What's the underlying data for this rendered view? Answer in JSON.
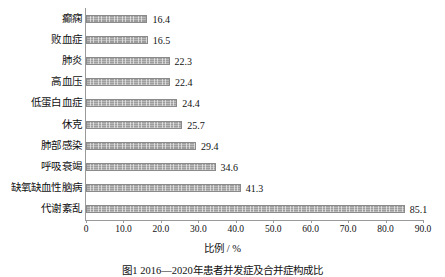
{
  "chart_data": {
    "type": "bar",
    "orientation": "horizontal",
    "title": "",
    "xlabel": "比例 / %",
    "ylabel": "",
    "xlim": [
      0,
      90
    ],
    "xticks": [
      "0",
      "10.0",
      "20.0",
      "30.0",
      "40.0",
      "50.0",
      "60.0",
      "70.0",
      "80.0",
      "90.0"
    ],
    "xtick_values": [
      0,
      10,
      20,
      30,
      40,
      50,
      60,
      70,
      80,
      90
    ],
    "grid": false,
    "legend": "none",
    "categories": [
      "癫痫",
      "败血症",
      "肺炎",
      "高血压",
      "低蛋白血症",
      "休克",
      "肺部感染",
      "呼吸衰竭",
      "缺氧缺血性脑病",
      "代谢紊乱"
    ],
    "values": [
      16.4,
      16.5,
      22.3,
      22.4,
      24.4,
      25.7,
      29.4,
      34.6,
      41.3,
      85.1
    ],
    "value_labels": [
      "16.4",
      "16.5",
      "22.3",
      "22.4",
      "24.4",
      "25.7",
      "29.4",
      "34.6",
      "41.3",
      "85.1"
    ],
    "bar_color": "#9d9d9d",
    "bar_pattern": "fine-vertical-hatch",
    "axis_color": "#9a9a9a"
  },
  "caption": {
    "text": "图1  2016—2020年患者并发症及合并症构成比"
  }
}
